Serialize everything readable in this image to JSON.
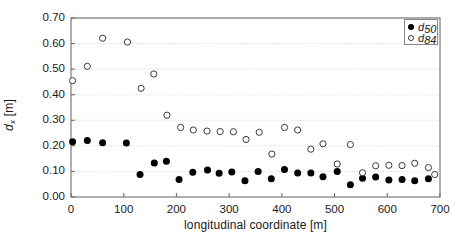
{
  "chart_data": {
    "type": "scatter",
    "title": "",
    "xlabel": "longitudinal coordinate [m]",
    "ylabel": "d_x [m]",
    "ylabel_base": "d",
    "ylabel_sub": "x",
    "ylabel_unit": " [m]",
    "xlim": [
      0,
      700
    ],
    "ylim": [
      0.0,
      0.7
    ],
    "xticks": [
      0,
      100,
      200,
      300,
      400,
      500,
      600,
      700
    ],
    "xtick_labels": [
      "0",
      "100",
      "200",
      "300",
      "400",
      "500",
      "600",
      "700"
    ],
    "yticks": [
      0.0,
      0.1,
      0.2,
      0.3,
      0.4,
      0.5,
      0.6,
      0.7
    ],
    "ytick_labels": [
      "0.00",
      "0.10",
      "0.20",
      "0.30",
      "0.40",
      "0.50",
      "0.60",
      "0.70"
    ],
    "grid": "horizontal-dotted",
    "grid_color": "#c8c8c8",
    "axis_color": "#6e6e6e",
    "legend_position": "top-right",
    "series": [
      {
        "name": "d50",
        "label_base": "d",
        "label_sub": "50",
        "marker": "filled-circle",
        "color": "#000000",
        "points": [
          [
            3,
            0.216
          ],
          [
            31,
            0.221
          ],
          [
            60,
            0.212
          ],
          [
            105,
            0.211
          ],
          [
            131,
            0.088
          ],
          [
            158,
            0.133
          ],
          [
            181,
            0.14
          ],
          [
            205,
            0.068
          ],
          [
            231,
            0.097
          ],
          [
            259,
            0.106
          ],
          [
            281,
            0.093
          ],
          [
            305,
            0.098
          ],
          [
            330,
            0.064
          ],
          [
            355,
            0.1
          ],
          [
            380,
            0.071
          ],
          [
            405,
            0.108
          ],
          [
            430,
            0.094
          ],
          [
            455,
            0.094
          ],
          [
            478,
            0.079
          ],
          [
            505,
            0.1
          ],
          [
            530,
            0.048
          ],
          [
            553,
            0.073
          ],
          [
            578,
            0.078
          ],
          [
            603,
            0.066
          ],
          [
            628,
            0.068
          ],
          [
            652,
            0.064
          ],
          [
            678,
            0.071
          ]
        ]
      },
      {
        "name": "d84",
        "label_base": "d",
        "label_sub": "84",
        "marker": "open-circle",
        "color": "#3a3a3a",
        "points": [
          [
            3,
            0.455
          ],
          [
            31,
            0.511
          ],
          [
            60,
            0.621
          ],
          [
            107,
            0.606
          ],
          [
            133,
            0.425
          ],
          [
            157,
            0.481
          ],
          [
            182,
            0.32
          ],
          [
            208,
            0.272
          ],
          [
            232,
            0.262
          ],
          [
            258,
            0.258
          ],
          [
            283,
            0.256
          ],
          [
            308,
            0.255
          ],
          [
            332,
            0.225
          ],
          [
            357,
            0.253
          ],
          [
            381,
            0.168
          ],
          [
            405,
            0.272
          ],
          [
            430,
            0.262
          ],
          [
            455,
            0.187
          ],
          [
            478,
            0.208
          ],
          [
            505,
            0.129
          ],
          [
            530,
            0.205
          ],
          [
            553,
            0.095
          ],
          [
            578,
            0.122
          ],
          [
            603,
            0.124
          ],
          [
            628,
            0.123
          ],
          [
            652,
            0.132
          ],
          [
            678,
            0.115
          ],
          [
            690,
            0.088
          ]
        ]
      }
    ]
  },
  "plot": {
    "left_px": 71,
    "top_px": 18,
    "right_px": 440,
    "bottom_px": 197
  }
}
